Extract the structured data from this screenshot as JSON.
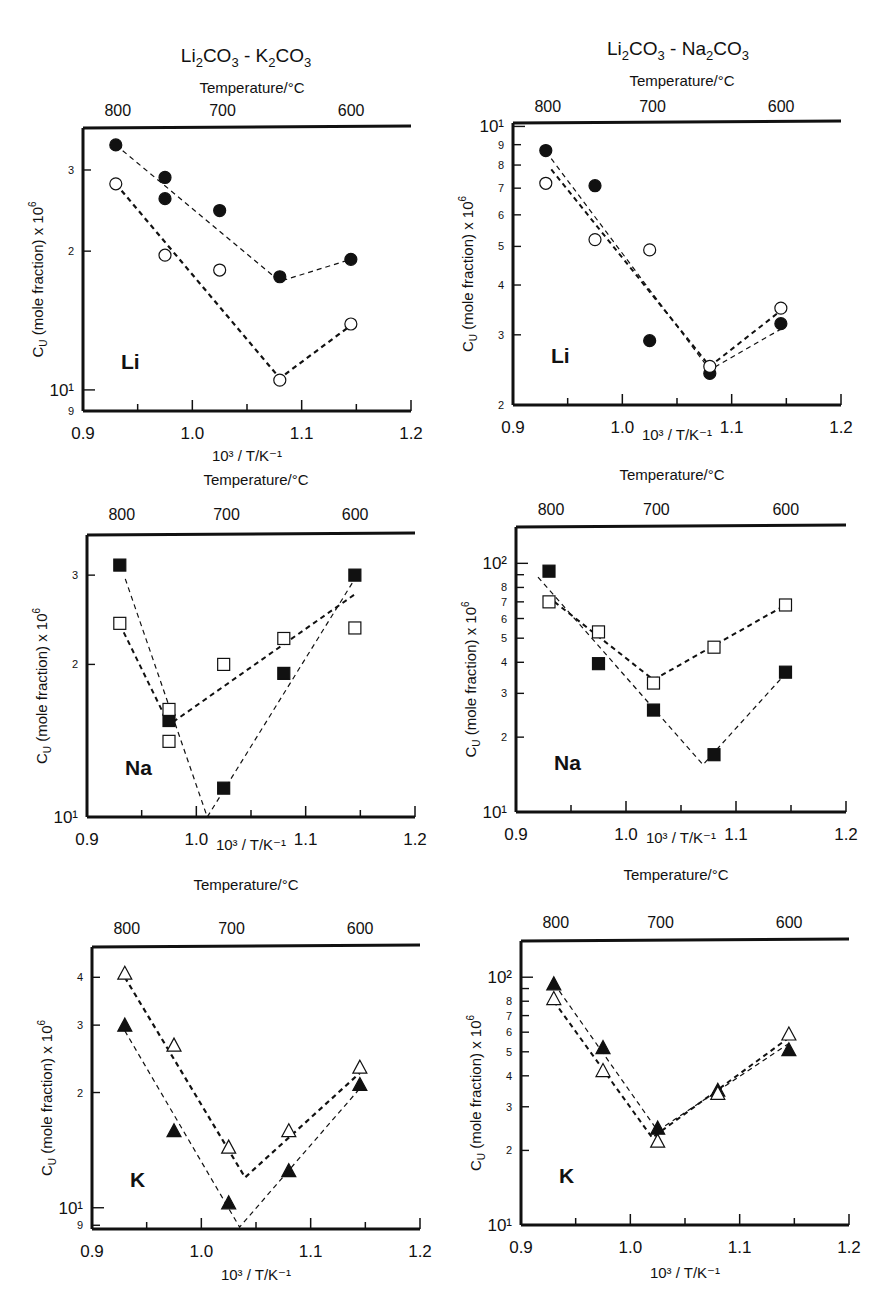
{
  "figure": {
    "columns": [
      {
        "title_parts": [
          "Li",
          "2",
          "CO",
          "3",
          " - K",
          "2",
          "CO",
          "3"
        ],
        "title": "Li2CO3 - K2CO3"
      },
      {
        "title_parts": [
          "Li",
          "2",
          "CO",
          "3",
          " - Na",
          "2",
          "CO",
          "3"
        ],
        "title": "Li2CO3 - Na2CO3"
      }
    ],
    "top_axis_label": "Temperature/°C",
    "top_ticks": [
      "800",
      "700",
      "600"
    ],
    "x_axis_label": "10³ / T/K⁻¹",
    "y_axis_label": "C_U (mole fraction) x 10⁶",
    "x_tick_labels": [
      "0.9",
      "1.0",
      "1.1",
      "1.2"
    ]
  },
  "chart_data": [
    {
      "id": "li-k2co3",
      "type": "scatter",
      "title": "Li2CO3 - K2CO3 : Li",
      "panel_label": "Li",
      "xlabel": "10^3 / T/K^-1",
      "ylabel": "C_U (mole fraction) x 10^6",
      "top_xlabel": "Temperature/°C",
      "top_ticks": [
        800,
        700,
        600
      ],
      "xlim": [
        0.9,
        1.2
      ],
      "yscale": "log",
      "ylim": [
        9,
        37
      ],
      "y_tick_labels": [
        "9",
        "10¹",
        "2",
        "3"
      ],
      "marker": "circle",
      "series": [
        {
          "name": "filled",
          "fill": "#111111",
          "x": [
            0.93,
            0.975,
            0.975,
            1.025,
            1.08,
            1.145
          ],
          "y": [
            34,
            28.9,
            26.0,
            24.5,
            17.6,
            19.2
          ],
          "fit": [
            [
              0.93,
              34
            ],
            [
              1.08,
              17.2
            ],
            [
              1.145,
              19.2
            ]
          ],
          "fit_width": 1.2
        },
        {
          "name": "open",
          "fill": "none",
          "x": [
            0.93,
            0.975,
            1.025,
            1.08,
            1.145
          ],
          "y": [
            28.0,
            19.6,
            18.2,
            10.5,
            13.9
          ],
          "fit": [
            [
              0.93,
              28
            ],
            [
              1.08,
              10.6
            ],
            [
              1.145,
              13.8
            ]
          ],
          "fit_width": 2.2
        }
      ]
    },
    {
      "id": "li-na2co3",
      "type": "scatter",
      "title": "Li2CO3 - Na2CO3 : Li",
      "panel_label": "Li",
      "xlabel": "10^3 / T/K^-1",
      "ylabel": "C_U (mole fraction) x 10^6",
      "top_xlabel": "Temperature/°C",
      "top_ticks": [
        800,
        700,
        600
      ],
      "xlim": [
        0.9,
        1.2
      ],
      "yscale": "log",
      "ylim": [
        2,
        10.2
      ],
      "y_tick_labels": [
        "2",
        "3",
        "4",
        "5",
        "6",
        "7",
        "8",
        "9"
      ],
      "marker": "circle",
      "series": [
        {
          "name": "filled",
          "fill": "#111111",
          "x": [
            0.93,
            0.975,
            1.025,
            1.08,
            1.145
          ],
          "y": [
            8.7,
            7.1,
            2.9,
            2.4,
            3.2
          ],
          "fit": [
            [
              0.935,
              8.3
            ],
            [
              1.08,
              2.45
            ],
            [
              1.145,
              3.1
            ]
          ],
          "fit_width": 1.2
        },
        {
          "name": "open",
          "fill": "none",
          "x": [
            0.93,
            0.975,
            1.025,
            1.08,
            1.145
          ],
          "y": [
            7.2,
            5.2,
            4.9,
            2.5,
            3.5
          ],
          "fit": [
            [
              0.935,
              7.8
            ],
            [
              1.08,
              2.5
            ],
            [
              1.145,
              3.45
            ]
          ],
          "fit_width": 2.0
        }
      ]
    },
    {
      "id": "na-k2co3",
      "type": "scatter",
      "title": "Li2CO3 - K2CO3 : Na",
      "panel_label": "Na",
      "xlabel": "10^3 / T/K^-1",
      "ylabel": "C_U (mole fraction) x 10^6",
      "top_xlabel": "Temperature/°C",
      "top_ticks": [
        800,
        700,
        600
      ],
      "xlim": [
        0.9,
        1.2
      ],
      "yscale": "log",
      "ylim": [
        10,
        36
      ],
      "y_tick_labels": [
        "10¹",
        "2",
        "3"
      ],
      "marker": "square",
      "series": [
        {
          "name": "filled",
          "fill": "#111111",
          "x": [
            0.93,
            0.975,
            1.025,
            1.08,
            1.145
          ],
          "y": [
            31.4,
            15.5,
            11.4,
            19.2,
            30
          ],
          "fit": [
            [
              0.935,
              29.5
            ],
            [
              1.01,
              10.0
            ],
            [
              1.145,
              29.5
            ]
          ],
          "fit_width": 1.2
        },
        {
          "name": "open",
          "fill": "none",
          "x": [
            0.93,
            0.975,
            0.975,
            1.025,
            1.08,
            1.145
          ],
          "y": [
            24.1,
            16.3,
            14.1,
            20,
            22.5,
            23.6
          ],
          "fit": [
            [
              0.93,
              24
            ],
            [
              0.975,
              15.2
            ],
            [
              1.145,
              27.5
            ]
          ],
          "fit_width": 2.0
        }
      ]
    },
    {
      "id": "na-na2co3",
      "type": "scatter",
      "title": "Li2CO3 - Na2CO3 : Na",
      "panel_label": "Na",
      "xlabel": "10^3 / T/K^-1",
      "ylabel": "C_U (mole fraction) x 10^6",
      "top_xlabel": "Temperature/°C",
      "top_ticks": [
        800,
        700,
        600
      ],
      "xlim": [
        0.9,
        1.2
      ],
      "yscale": "log",
      "ylim": [
        10,
        140
      ],
      "y_tick_labels": [
        "10¹",
        "2",
        "3",
        "4",
        "5",
        "6",
        "7",
        "8",
        "10²"
      ],
      "marker": "square",
      "series": [
        {
          "name": "filled",
          "fill": "#111111",
          "x": [
            0.93,
            0.975,
            1.025,
            1.08,
            1.145
          ],
          "y": [
            93,
            39.5,
            25.7,
            17,
            36.5
          ],
          "fit": [
            [
              0.92,
              88
            ],
            [
              1.07,
              15.5
            ],
            [
              1.145,
              36
            ]
          ],
          "fit_width": 1.2
        },
        {
          "name": "open",
          "fill": "none",
          "x": [
            0.93,
            0.975,
            1.025,
            1.08,
            1.145
          ],
          "y": [
            70,
            53,
            33,
            46,
            68
          ],
          "fit": [
            [
              0.935,
              70
            ],
            [
              1.025,
              34
            ],
            [
              1.145,
              68
            ]
          ],
          "fit_width": 2.0
        }
      ]
    },
    {
      "id": "k-k2co3",
      "type": "scatter",
      "title": "Li2CO3 - K2CO3 : K",
      "panel_label": "K",
      "xlabel": "10^3 / T/K^-1",
      "ylabel": "C_U (mole fraction) x 10^6",
      "top_xlabel": "Temperature/°C",
      "top_ticks": [
        800,
        700,
        600
      ],
      "xlim": [
        0.9,
        1.2
      ],
      "yscale": "log",
      "ylim": [
        8.8,
        48
      ],
      "y_tick_labels": [
        "9",
        "10¹",
        "2",
        "3",
        "4"
      ],
      "marker": "triangle",
      "series": [
        {
          "name": "filled",
          "fill": "#111111",
          "x": [
            0.93,
            0.975,
            1.025,
            1.08,
            1.145
          ],
          "y": [
            30,
            15.9,
            10.3,
            12.5,
            21
          ],
          "fit": [
            [
              0.93,
              29
            ],
            [
              1.035,
              8.9
            ],
            [
              1.145,
              20.5
            ]
          ],
          "fit_width": 1.2
        },
        {
          "name": "open",
          "fill": "none",
          "x": [
            0.93,
            0.975,
            1.025,
            1.08,
            1.145
          ],
          "y": [
            41,
            26.6,
            14.4,
            15.9,
            23.3
          ],
          "fit": [
            [
              0.93,
              40
            ],
            [
              1.04,
              12
            ],
            [
              1.145,
              22.5
            ]
          ],
          "fit_width": 2.2
        }
      ]
    },
    {
      "id": "k-na2co3",
      "type": "scatter",
      "title": "Li2CO3 - Na2CO3 : K",
      "panel_label": "K",
      "xlabel": "10^3 / T/K^-1",
      "ylabel": "C_U (mole fraction) x 10^6",
      "top_xlabel": "Temperature/°C",
      "top_ticks": [
        800,
        700,
        600
      ],
      "xlim": [
        0.9,
        1.2
      ],
      "yscale": "log",
      "ylim": [
        10,
        140
      ],
      "y_tick_labels": [
        "10¹",
        "2",
        "3",
        "4",
        "5",
        "6",
        "7",
        "8",
        "10²"
      ],
      "marker": "triangle",
      "series": [
        {
          "name": "filled",
          "fill": "#111111",
          "x": [
            0.93,
            0.975,
            1.025,
            1.08,
            1.145
          ],
          "y": [
            94,
            52,
            24.6,
            35,
            51
          ],
          "fit": [
            [
              0.935,
              88
            ],
            [
              1.025,
              24
            ],
            [
              1.145,
              54
            ]
          ],
          "fit_width": 1.2
        },
        {
          "name": "open",
          "fill": "none",
          "x": [
            0.93,
            0.975,
            1.025,
            1.08,
            1.145
          ],
          "y": [
            82,
            42,
            21.8,
            34,
            59
          ],
          "fit": [
            [
              0.93,
              80
            ],
            [
              1.02,
              22.5
            ],
            [
              1.145,
              57
            ]
          ],
          "fit_width": 2.0
        }
      ]
    }
  ]
}
